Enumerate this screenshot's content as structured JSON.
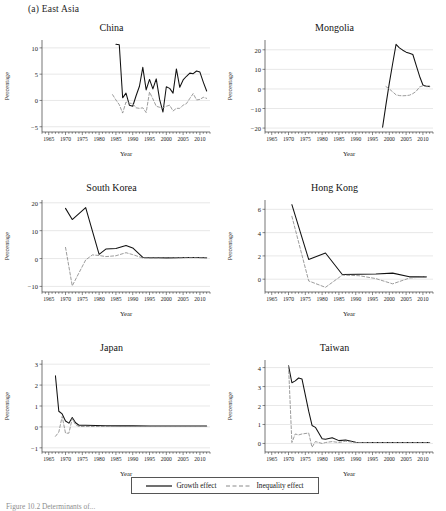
{
  "figure": {
    "panel_label": "(a) East Asia",
    "caption": "Figure 10.2  Determinants of...",
    "axis": {
      "ylabel": "Percentage",
      "xlabel": "Year"
    },
    "xticks": [
      1965,
      1970,
      1975,
      1980,
      1985,
      1990,
      1995,
      2000,
      2005,
      2010
    ],
    "xlim": [
      1963,
      2013
    ]
  },
  "legend": {
    "position": "bottom-center",
    "items": [
      {
        "label": "Growth effect",
        "style": "solid",
        "color": "#111111"
      },
      {
        "label": "Inequality effect",
        "style": "dashed",
        "color": "#8a8a8a"
      }
    ]
  },
  "chart_data": [
    {
      "type": "line",
      "title": "China",
      "xlabel": "Year",
      "ylabel": "Percentage",
      "xlim": [
        1963,
        2013
      ],
      "ylim": [
        -6,
        11.5
      ],
      "yticks": [
        -5,
        0,
        5,
        10
      ],
      "grid": true,
      "series": [
        {
          "name": "Growth effect",
          "style": "solid",
          "x": [
            1985,
            1986,
            1987,
            1988,
            1989,
            1990,
            1991,
            1992,
            1993,
            1994,
            1995,
            1996,
            1997,
            1998,
            1999,
            2000,
            2001,
            2002,
            2003,
            2004,
            2005,
            2006,
            2007,
            2008,
            2009,
            2010,
            2011,
            2012
          ],
          "y": [
            10.7,
            10.6,
            0.5,
            1.4,
            -0.9,
            -1.1,
            0.9,
            2.7,
            6.3,
            2.0,
            4.0,
            2.2,
            4.1,
            0.2,
            -2.2,
            2.6,
            2.3,
            1.4,
            6.0,
            2.5,
            3.9,
            4.6,
            5.2,
            5.1,
            5.6,
            5.4,
            3.5,
            1.8
          ]
        },
        {
          "name": "Inequality effect",
          "style": "dashed",
          "x": [
            1984,
            1985,
            1986,
            1987,
            1988,
            1989,
            1990,
            1991,
            1992,
            1993,
            1994,
            1995,
            1996,
            1997,
            1998,
            1999,
            2000,
            2001,
            2002,
            2003,
            2004,
            2005,
            2006,
            2007,
            2008,
            2009,
            2010,
            2011,
            2012
          ],
          "y": [
            1.1,
            0.1,
            -0.8,
            -2.4,
            -0.3,
            -0.5,
            -0.6,
            -1.4,
            -1.5,
            -1.4,
            -2.3,
            1.6,
            0.3,
            -1.1,
            -1.3,
            -1.4,
            -1.1,
            -0.9,
            -2.0,
            -1.5,
            -1.5,
            -0.9,
            -0.6,
            0.4,
            1.3,
            0.1,
            0.2,
            0.6,
            0.4
          ]
        }
      ]
    },
    {
      "type": "line",
      "title": "Mongolia",
      "xlabel": "Year",
      "ylabel": "Percentage",
      "xlim": [
        1963,
        2013
      ],
      "ylim": [
        -22,
        25
      ],
      "yticks": [
        -20,
        -10,
        0,
        10,
        20
      ],
      "grid": true,
      "series": [
        {
          "name": "Growth effect",
          "style": "solid",
          "x": [
            1998,
            1999,
            2000,
            2001,
            2002,
            2003,
            2004,
            2005,
            2006,
            2007,
            2008,
            2009,
            2010,
            2011,
            2012
          ],
          "y": [
            -19.5,
            -8.0,
            3.0,
            13.0,
            22.8,
            21.0,
            19.8,
            18.8,
            18.2,
            17.6,
            12.0,
            6.5,
            2.0,
            1.4,
            1.3
          ]
        },
        {
          "name": "Inequality effect",
          "style": "dashed",
          "x": [
            1999,
            2000,
            2001,
            2002,
            2003,
            2004,
            2005,
            2006,
            2007,
            2008,
            2009,
            2010,
            2011,
            2012
          ],
          "y": [
            1.2,
            0.0,
            -1.5,
            -3.0,
            -3.4,
            -3.5,
            -3.4,
            -3.2,
            -2.4,
            -1.2,
            1.0,
            1.6,
            1.2,
            1.1
          ]
        }
      ]
    },
    {
      "type": "line",
      "title": "South Korea",
      "xlabel": "Year",
      "ylabel": "Percentage",
      "xlim": [
        1963,
        2013
      ],
      "ylim": [
        -12,
        21
      ],
      "yticks": [
        -10,
        0,
        10,
        20
      ],
      "grid": true,
      "series": [
        {
          "name": "Growth effect",
          "style": "solid",
          "x": [
            1970,
            1972,
            1976,
            1980,
            1982,
            1985,
            1988,
            1990,
            1993,
            1995,
            1998,
            2000,
            2003,
            2006,
            2009,
            2012
          ],
          "y": [
            18.0,
            14.0,
            18.3,
            1.5,
            3.4,
            3.6,
            4.7,
            3.8,
            0.4,
            0.3,
            0.25,
            0.25,
            0.3,
            0.4,
            0.35,
            0.3
          ]
        },
        {
          "name": "Inequality effect",
          "style": "dashed",
          "x": [
            1970,
            1972,
            1976,
            1978,
            1980,
            1982,
            1985,
            1988,
            1990,
            1993,
            1995,
            1998,
            2000,
            2003,
            2006,
            2009,
            2012
          ],
          "y": [
            4.0,
            -9.8,
            -0.5,
            1.3,
            1.1,
            0.7,
            1.0,
            2.1,
            1.4,
            0.2,
            0.2,
            0.2,
            0.2,
            0.25,
            0.3,
            0.3,
            0.25
          ]
        }
      ]
    },
    {
      "type": "line",
      "title": "Hong Kong",
      "xlabel": "Year",
      "ylabel": "Percentage",
      "xlim": [
        1963,
        2013
      ],
      "ylim": [
        -1.1,
        6.8
      ],
      "yticks": [
        0,
        2,
        4,
        6
      ],
      "grid": true,
      "series": [
        {
          "name": "Growth effect",
          "style": "solid",
          "x": [
            1971,
            1976,
            1981,
            1986,
            1991,
            1996,
            2001,
            2006,
            2011
          ],
          "y": [
            6.4,
            1.7,
            2.25,
            0.4,
            0.42,
            0.45,
            0.52,
            0.2,
            0.2
          ]
        },
        {
          "name": "Inequality effect",
          "style": "dashed",
          "x": [
            1971,
            1976,
            1981,
            1986,
            1991,
            1996,
            2001,
            2006,
            2011
          ],
          "y": [
            5.4,
            -0.15,
            -0.7,
            0.35,
            0.3,
            0.05,
            -0.4,
            0.1,
            0.2
          ]
        }
      ]
    },
    {
      "type": "line",
      "title": "Japan",
      "xlabel": "Year",
      "ylabel": "Percentage",
      "xlim": [
        1963,
        2013
      ],
      "ylim": [
        -1.2,
        3.2
      ],
      "yticks": [
        -1,
        0,
        1,
        2,
        3
      ],
      "grid": true,
      "series": [
        {
          "name": "Growth effect",
          "style": "solid",
          "x": [
            1967,
            1968,
            1969,
            1970,
            1971,
            1972,
            1973,
            1974,
            1976,
            1979,
            1982,
            1986,
            1990,
            1995,
            2000,
            2005,
            2010,
            2012
          ],
          "y": [
            2.45,
            0.75,
            0.62,
            0.28,
            0.18,
            0.45,
            0.2,
            0.08,
            0.08,
            0.07,
            0.06,
            0.05,
            0.05,
            0.04,
            0.04,
            0.04,
            0.04,
            0.04
          ]
        },
        {
          "name": "Inequality effect",
          "style": "dashed",
          "x": [
            1967,
            1968,
            1969,
            1970,
            1971,
            1972,
            1973,
            1974,
            1976,
            1979,
            1982,
            1986,
            1990,
            1995,
            2000,
            2005,
            2010,
            2012
          ],
          "y": [
            -0.45,
            -0.25,
            0.5,
            -0.3,
            -0.3,
            0.4,
            0.1,
            0.02,
            0.02,
            0.02,
            0.02,
            0.02,
            0.02,
            0.02,
            0.02,
            0.02,
            0.02,
            0.02
          ]
        }
      ]
    },
    {
      "type": "line",
      "title": "Taiwan",
      "xlabel": "Year",
      "ylabel": "Percentage",
      "xlim": [
        1963,
        2013
      ],
      "ylim": [
        -0.45,
        4.4
      ],
      "yticks": [
        0,
        1,
        2,
        3,
        4
      ],
      "grid": true,
      "series": [
        {
          "name": "Growth effect",
          "style": "solid",
          "x": [
            1970,
            1971,
            1972,
            1973,
            1974,
            1976,
            1977,
            1978,
            1979,
            1980,
            1981,
            1983,
            1985,
            1987,
            1990,
            1995,
            2000,
            2005,
            2010,
            2012
          ],
          "y": [
            4.1,
            3.2,
            3.3,
            3.45,
            3.4,
            1.7,
            0.95,
            0.85,
            0.55,
            0.25,
            0.22,
            0.3,
            0.15,
            0.18,
            0.06,
            0.05,
            0.05,
            0.05,
            0.05,
            0.05
          ]
        },
        {
          "name": "Inequality effect",
          "style": "dashed",
          "x": [
            1970,
            1971,
            1972,
            1973,
            1974,
            1976,
            1977,
            1978,
            1979,
            1980,
            1981,
            1983,
            1985,
            1987,
            1990,
            1995,
            2000,
            2005,
            2010,
            2012
          ],
          "y": [
            4.1,
            0.05,
            0.5,
            0.45,
            0.5,
            0.55,
            -0.2,
            0.1,
            0.05,
            0.0,
            0.05,
            0.1,
            0.05,
            0.12,
            0.05,
            0.05,
            0.05,
            0.05,
            0.05,
            0.05
          ]
        }
      ]
    }
  ]
}
